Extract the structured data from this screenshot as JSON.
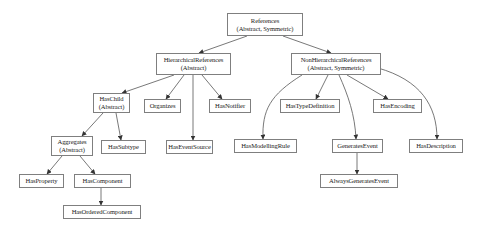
{
  "diagram": {
    "type": "reference-type-hierarchy",
    "colors": {
      "border": "#7f7f7f",
      "edge": "#555555",
      "text": "#222222",
      "background": "#ffffff"
    },
    "nodes": [
      {
        "id": "references",
        "line1": "References",
        "line2": "(Abstract, Symmetric)",
        "x": 227,
        "y": 13,
        "w": 76,
        "h": 23
      },
      {
        "id": "hierarchical",
        "line1": "HierarchicalReferences",
        "line2": "(Abstract)",
        "x": 156,
        "y": 53,
        "w": 75,
        "h": 22
      },
      {
        "id": "nonhierarchical",
        "line1": "NonHierarchicalReferences",
        "line2": "(Abstract, Symmetric)",
        "x": 291,
        "y": 53,
        "w": 90,
        "h": 22
      },
      {
        "id": "haschild",
        "line1": "HasChild",
        "line2": "(Abstract)",
        "x": 93,
        "y": 93,
        "w": 37,
        "h": 20
      },
      {
        "id": "organizes",
        "line1": "Organizes",
        "line2": "",
        "x": 144,
        "y": 99,
        "w": 37,
        "h": 14
      },
      {
        "id": "hasnotifier",
        "line1": "HasNotifier",
        "line2": "",
        "x": 209,
        "y": 99,
        "w": 42,
        "h": 14
      },
      {
        "id": "hastypedefinition",
        "line1": "HasTypeDefinition",
        "line2": "",
        "x": 280,
        "y": 99,
        "w": 60,
        "h": 14
      },
      {
        "id": "hasencoding",
        "line1": "HasEncoding",
        "line2": "",
        "x": 373,
        "y": 99,
        "w": 49,
        "h": 14
      },
      {
        "id": "aggregates",
        "line1": "Aggregates",
        "line2": "(Abstract)",
        "x": 51,
        "y": 136,
        "w": 42,
        "h": 20
      },
      {
        "id": "hassubtype",
        "line1": "HasSubtype",
        "line2": "",
        "x": 101,
        "y": 140,
        "w": 45,
        "h": 14
      },
      {
        "id": "haseventsource",
        "line1": "HasEventSource",
        "line2": "",
        "x": 166,
        "y": 140,
        "w": 47,
        "h": 14
      },
      {
        "id": "hasmodellingrule",
        "line1": "HasModellingRule",
        "line2": "",
        "x": 234,
        "y": 139,
        "w": 63,
        "h": 14
      },
      {
        "id": "generatesevent",
        "line1": "GeneratesEvent",
        "line2": "",
        "x": 332,
        "y": 139,
        "w": 51,
        "h": 14
      },
      {
        "id": "hasdescription",
        "line1": "HasDescription",
        "line2": "",
        "x": 409,
        "y": 139,
        "w": 54,
        "h": 14
      },
      {
        "id": "hasproperty",
        "line1": "HasProperty",
        "line2": "",
        "x": 19,
        "y": 174,
        "w": 45,
        "h": 14
      },
      {
        "id": "hascomponent",
        "line1": "HasComponent",
        "line2": "",
        "x": 74,
        "y": 174,
        "w": 57,
        "h": 14
      },
      {
        "id": "alwaysgeneratesevent",
        "line1": "AlwaysGeneratesEvent",
        "line2": "",
        "x": 320,
        "y": 174,
        "w": 78,
        "h": 14
      },
      {
        "id": "hasorderedcomponent",
        "line1": "HasOrderedComponent",
        "line2": "",
        "x": 63,
        "y": 205,
        "w": 78,
        "h": 14
      }
    ],
    "edges": [
      {
        "from": "references",
        "to": "hierarchical",
        "path": "M247,36 L199,53"
      },
      {
        "from": "references",
        "to": "nonhierarchical",
        "path": "M283,36 L331,53"
      },
      {
        "from": "hierarchical",
        "to": "haschild",
        "path": "M174,75 L122,93"
      },
      {
        "from": "hierarchical",
        "to": "organizes",
        "path": "M184,75 L166,99"
      },
      {
        "from": "hierarchical",
        "to": "haseventsource",
        "path": "M193,75 L193,140"
      },
      {
        "from": "hierarchical",
        "to": "hasnotifier",
        "path": "M202,75 L222,99"
      },
      {
        "from": "haschild",
        "to": "aggregates",
        "path": "M103,113 L82,136"
      },
      {
        "from": "haschild",
        "to": "hassubtype",
        "path": "M116,113 L121,140"
      },
      {
        "from": "aggregates",
        "to": "hasproperty",
        "path": "M62,156 L47,174"
      },
      {
        "from": "aggregates",
        "to": "hascomponent",
        "path": "M80,156 L95,174"
      },
      {
        "from": "hascomponent",
        "to": "hasorderedcomponent",
        "path": "M101,188 L101,205"
      },
      {
        "from": "nonhierarchical",
        "to": "hasmodellingrule",
        "path": "M302,75 C270,95 262,110 263,139"
      },
      {
        "from": "nonhierarchical",
        "to": "hastypedefinition",
        "path": "M328,75 L316,99"
      },
      {
        "from": "nonhierarchical",
        "to": "generatesevent",
        "path": "M339,75 C348,95 355,115 356,139"
      },
      {
        "from": "nonhierarchical",
        "to": "hasencoding",
        "path": "M347,75 L388,99"
      },
      {
        "from": "nonhierarchical",
        "to": "hasdescription",
        "path": "M378,68 C420,80 437,105 437,139"
      },
      {
        "from": "generatesevent",
        "to": "alwaysgeneratesevent",
        "path": "M357,153 L357,174"
      }
    ]
  }
}
